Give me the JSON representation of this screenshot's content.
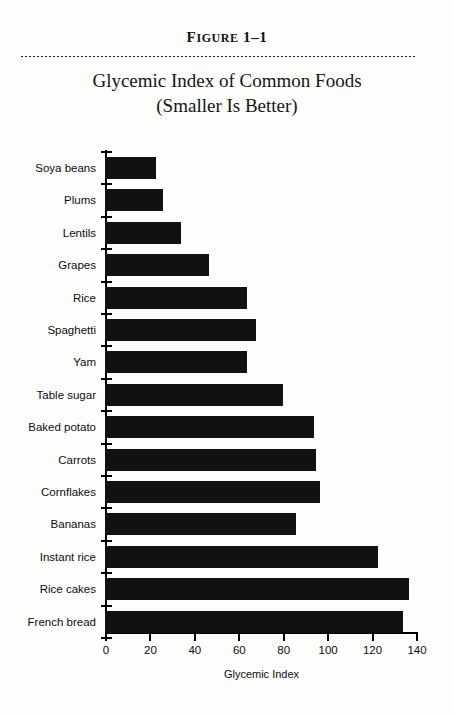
{
  "figure": {
    "number_prefix": "F",
    "number_rest": "IGURE",
    "number_id": "1–1",
    "title_line1": "Glycemic Index of Common Foods",
    "title_line2": "(Smaller Is Better)"
  },
  "colors": {
    "bar": "#111111",
    "axis": "#000000",
    "page": "#fdfdfc",
    "rule": "#1a1a1a"
  },
  "chart_data": {
    "type": "bar",
    "orientation": "horizontal",
    "title": "Glycemic Index of Common Foods (Smaller Is Better)",
    "xlabel": "Glycemic Index",
    "ylabel": "",
    "xlim": [
      0,
      140
    ],
    "xticks": [
      0,
      20,
      40,
      60,
      80,
      100,
      120,
      140
    ],
    "grid": false,
    "legend": false,
    "categories": [
      "Soya beans",
      "Plums",
      "Lentils",
      "Grapes",
      "Rice",
      "Spaghetti",
      "Yam",
      "Table sugar",
      "Baked potato",
      "Carrots",
      "Cornflakes",
      "Bananas",
      "Instant rice",
      "Rice cakes",
      "French bread"
    ],
    "values": [
      23,
      26,
      34,
      47,
      64,
      68,
      64,
      80,
      94,
      95,
      97,
      86,
      123,
      137,
      134
    ]
  }
}
